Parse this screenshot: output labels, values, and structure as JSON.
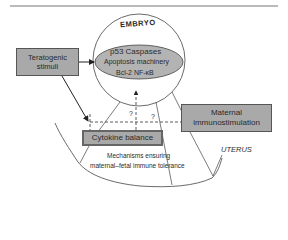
{
  "diagram": {
    "embryo": {
      "title": "EMBRYO",
      "inner_line1": "p53  Caspases",
      "inner_line2": "Apoptosis machinery",
      "inner_line3": "Bcl-2  NF-κB"
    },
    "teratogenic": {
      "line1": "Teratogenic",
      "line2": "stimuli"
    },
    "maternal": {
      "line1": "Maternal",
      "line2": "immunostimulation"
    },
    "cytokine": {
      "label": "Cytokine balance"
    },
    "mechanisms": {
      "line1": "Mechanisms ensuring",
      "line2": "maternal–fetal immune tolerance"
    },
    "uterus": {
      "label": "UTERUS"
    },
    "question_marks": [
      "?",
      "?"
    ],
    "colors": {
      "box_fill": "#a9a9a9",
      "ellipse_fill": "#b3b3b3",
      "line": "#333333"
    }
  }
}
